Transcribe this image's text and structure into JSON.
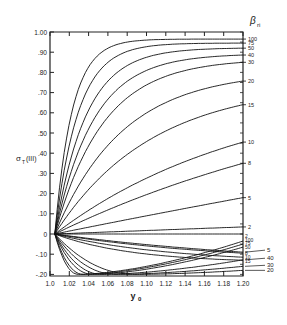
{
  "chart_data": {
    "type": "line",
    "title": "",
    "xlabel": "y0",
    "ylabel": "σT (III)",
    "legend_title": "βri",
    "xlim": [
      1.0,
      1.2
    ],
    "ylim": [
      -0.2,
      1.0
    ],
    "grid": false,
    "x_ticks": [
      "1.0",
      "1.02",
      "1.04",
      "1.06",
      "1.08",
      "1.10",
      "1.12",
      "1.14",
      "1.16",
      "1.18",
      "1.20"
    ],
    "y_ticks": [
      "1.00",
      ".90",
      ".80",
      ".70",
      ".60",
      ".50",
      ".40",
      ".30",
      ".20",
      ".10",
      "0",
      "-.10",
      "-.20"
    ],
    "upper_series": [
      {
        "name": "100",
        "end_value": 0.965,
        "k": 0.075
      },
      {
        "name": "75",
        "end_value": 0.945,
        "k": 0.055
      },
      {
        "name": "50",
        "end_value": 0.92,
        "k": 0.04
      },
      {
        "name": "40",
        "end_value": 0.886,
        "k": 0.03
      },
      {
        "name": "30",
        "end_value": 0.85,
        "k": 0.02
      },
      {
        "name": "20",
        "end_value": 0.757,
        "k": 0.01
      },
      {
        "name": "15",
        "end_value": 0.64,
        "k": 0.005
      },
      {
        "name": "10",
        "end_value": 0.455,
        "k": 0.002
      },
      {
        "name": "8",
        "end_value": 0.35,
        "k": 0.001
      },
      {
        "name": "5",
        "end_value": 0.18,
        "k": 0.0
      },
      {
        "name": "2",
        "end_value": 0.035,
        "k": 0.0
      }
    ],
    "lower_series": [
      {
        "name": "2",
        "end_value": 0.0,
        "min_x": 1.2,
        "min_value": 0.0
      },
      {
        "name": "100",
        "end_value": -0.035,
        "min_x": 1.03,
        "min_value": -0.2
      },
      {
        "name": "75",
        "end_value": -0.05,
        "min_x": 1.035,
        "min_value": -0.2
      },
      {
        "name": "5",
        "end_value": -0.09,
        "min_x": 1.2,
        "min_value": -0.09
      },
      {
        "name": "50",
        "end_value": -0.065,
        "min_x": 1.045,
        "min_value": -0.2
      },
      {
        "name": "40",
        "end_value": -0.128,
        "min_x": 1.055,
        "min_value": -0.2
      },
      {
        "name": "8",
        "end_value": -0.095,
        "min_x": 1.2,
        "min_value": -0.095
      },
      {
        "name": "30",
        "end_value": -0.16,
        "min_x": 1.07,
        "min_value": -0.2
      },
      {
        "name": "10",
        "end_value": -0.115,
        "min_x": 1.2,
        "min_value": -0.115
      },
      {
        "name": "20",
        "end_value": -0.18,
        "min_x": 1.09,
        "min_value": -0.2
      },
      {
        "name": "15",
        "end_value": -0.13,
        "min_x": 1.2,
        "min_value": -0.13
      }
    ],
    "right_labels_inner": [
      "100",
      "75",
      "50",
      "40",
      "30",
      "20",
      "15",
      "10",
      "8",
      "5",
      "2",
      "2",
      "100",
      "75",
      "50",
      "8",
      "10",
      "15"
    ],
    "right_labels_outer": [
      "5",
      "40",
      "30",
      "20"
    ]
  }
}
